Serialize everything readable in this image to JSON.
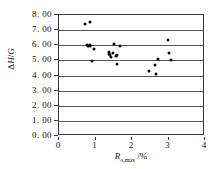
{
  "chart_data": {
    "type": "scatter",
    "title": "",
    "xlabel": "Ro,max /%",
    "xlabel_parts": {
      "symbol": "R",
      "subscript": "o,max",
      "unit": "/%"
    },
    "ylabel": "ΔH/G",
    "ylabel_parts": {
      "prefix": "Δ",
      "symbol": "H",
      "divider": "/",
      "denominator": "G"
    },
    "xlim": [
      0,
      4
    ],
    "ylim": [
      0,
      8
    ],
    "xticks": [
      0,
      1,
      2,
      3,
      4
    ],
    "xtick_labels": [
      "0",
      "1",
      "2",
      "3",
      "4"
    ],
    "yticks": [
      0,
      1,
      2,
      3,
      4,
      5,
      6,
      7,
      8
    ],
    "ytick_labels": [
      "0. 00",
      "1. 00",
      "2. 00",
      "3. 00",
      "4. 00",
      "5. 00",
      "6. 00",
      "7. 00",
      "8. 00"
    ],
    "grid": {
      "horizontal": true,
      "vertical": false
    },
    "legend": null,
    "marker": {
      "shape": "diamond-dot",
      "color": "#000000",
      "size": 3
    },
    "points": [
      {
        "x": 0.72,
        "y": 7.4
      },
      {
        "x": 0.86,
        "y": 7.55
      },
      {
        "x": 0.78,
        "y": 6.02
      },
      {
        "x": 0.8,
        "y": 5.95
      },
      {
        "x": 0.84,
        "y": 6.0
      },
      {
        "x": 0.86,
        "y": 5.92
      },
      {
        "x": 0.95,
        "y": 5.72
      },
      {
        "x": 0.9,
        "y": 4.98
      },
      {
        "x": 1.36,
        "y": 5.58
      },
      {
        "x": 1.38,
        "y": 5.45
      },
      {
        "x": 1.4,
        "y": 5.38
      },
      {
        "x": 1.43,
        "y": 5.2
      },
      {
        "x": 1.48,
        "y": 5.52
      },
      {
        "x": 1.52,
        "y": 6.05
      },
      {
        "x": 1.55,
        "y": 5.3
      },
      {
        "x": 1.58,
        "y": 5.35
      },
      {
        "x": 1.6,
        "y": 4.78
      },
      {
        "x": 1.68,
        "y": 5.92
      },
      {
        "x": 2.46,
        "y": 4.3
      },
      {
        "x": 2.62,
        "y": 4.72
      },
      {
        "x": 2.66,
        "y": 4.08
      },
      {
        "x": 2.72,
        "y": 5.12
      },
      {
        "x": 2.98,
        "y": 6.32
      },
      {
        "x": 3.0,
        "y": 5.5
      },
      {
        "x": 3.06,
        "y": 5.02
      }
    ]
  },
  "colors": {
    "axis": "#3a3a3a",
    "gridline": "#555555",
    "marker": "#000000",
    "background": "#ffffff",
    "text": "#111111"
  }
}
